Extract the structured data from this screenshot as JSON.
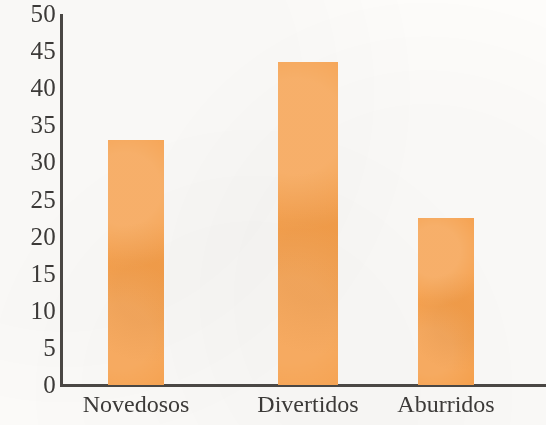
{
  "chart_data": {
    "type": "bar",
    "title": "",
    "subtitle": "",
    "xlabel": "",
    "ylabel": "",
    "categories": [
      "Novedosos",
      "Divertidos",
      "Aburridos"
    ],
    "values": [
      33,
      43.5,
      22.5
    ],
    "series": [
      {
        "name": "",
        "values": [
          33,
          43.5,
          22.5
        ]
      }
    ],
    "ylim": [
      0,
      50
    ],
    "ytick_labels": [
      "50",
      "45",
      "40",
      "35",
      "30",
      "25",
      "20",
      "15",
      "10",
      "5",
      "0"
    ],
    "ytick_values": [
      50,
      45,
      40,
      35,
      30,
      25,
      20,
      15,
      10,
      5,
      0
    ],
    "ytick_step": 5,
    "grid": false,
    "legend": false,
    "legend_position": "none",
    "bar_color": "#f5a04d",
    "axis_color": "#4a4744",
    "text_color": "#3c3a38",
    "background_color": "#fdfcfa"
  }
}
